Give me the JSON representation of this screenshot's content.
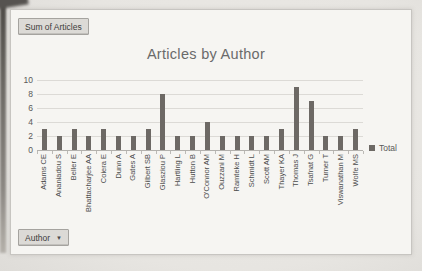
{
  "pivot": {
    "value_button_label": "Sum of Articles",
    "axis_button_label": "Author",
    "dropdown_icon": "▼"
  },
  "chart_data": {
    "type": "bar",
    "title": "Articles by Author",
    "categories": [
      "Adams CE",
      "Ananiadou S",
      "Beller E",
      "Bhattacharjee AA",
      "Coiera E",
      "Dunn A",
      "Gates A",
      "Gilbert SB",
      "Glasziou P",
      "Hartling L",
      "Hutton B",
      "O'Connor AM",
      "Ouzzani M",
      "Ramteke H",
      "Schmidt L",
      "Scott AM",
      "Thayer KA",
      "Thomas J",
      "Tsafnat G",
      "Turner T",
      "Viswanathan M",
      "Wolfe MS"
    ],
    "series": [
      {
        "name": "Total",
        "values": [
          3,
          2,
          3,
          2,
          3,
          2,
          2,
          3,
          8,
          2,
          2,
          4,
          2,
          2,
          2,
          2,
          3,
          9,
          7,
          2,
          2,
          3
        ]
      }
    ],
    "ylim": [
      0,
      10
    ],
    "yticks": [
      0,
      2,
      4,
      6,
      8,
      10
    ],
    "grid": true,
    "legend_position": "right",
    "bar_color": "#6d6965",
    "gridline_color": "#dcdad6",
    "text_color": "#595959"
  }
}
